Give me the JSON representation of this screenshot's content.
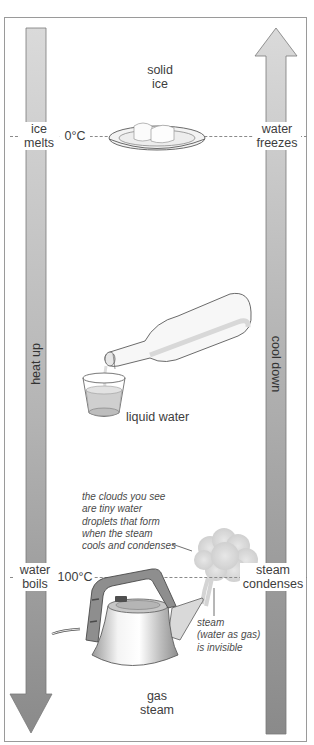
{
  "diagram": {
    "left_arrow": {
      "label": "heat up",
      "direction": "down"
    },
    "right_arrow": {
      "label": "cool down",
      "direction": "up"
    },
    "states": {
      "solid": {
        "line1": "solid",
        "line2": "ice"
      },
      "liquid": {
        "label": "liquid water"
      },
      "gas": {
        "line1": "gas",
        "line2": "steam"
      }
    },
    "thresholds": {
      "freezing": {
        "temp": "0°C",
        "left_line1": "ice",
        "left_line2": "melts",
        "right_line1": "water",
        "right_line2": "freezes"
      },
      "boiling": {
        "temp": "100°C",
        "left_line1": "water",
        "left_line2": "boils",
        "right_line1": "steam",
        "right_line2": "condenses"
      }
    },
    "annotations": {
      "clouds": [
        "the clouds you see",
        "are tiny water",
        "droplets that form",
        "when the steam",
        "cools and condenses"
      ],
      "steam": [
        "steam",
        "(water as gas)",
        "is invisible"
      ]
    },
    "illustrations": {
      "plate": "plate-with-ice-cubes",
      "bottle": "bottle-pouring-water",
      "glass": "glass-of-water",
      "kettle": "electric-kettle",
      "cloud": "steam-cloud"
    },
    "colors": {
      "arrow_light": "#d6d6d6",
      "arrow_dark": "#8c8c8c",
      "outline": "#7a7a7a",
      "frame": "#9a9a9a",
      "text": "#3d3d3d"
    }
  }
}
